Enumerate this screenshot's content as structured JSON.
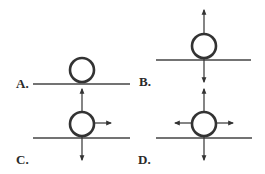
{
  "diagram": {
    "stroke_color": "#333333",
    "panels": [
      {
        "label": "A.",
        "forces": []
      },
      {
        "label": "B.",
        "forces": [
          "up",
          "down"
        ]
      },
      {
        "label": "C.",
        "forces": [
          "up",
          "down",
          "right"
        ]
      },
      {
        "label": "D.",
        "forces": [
          "up",
          "down",
          "left",
          "right"
        ]
      }
    ]
  }
}
